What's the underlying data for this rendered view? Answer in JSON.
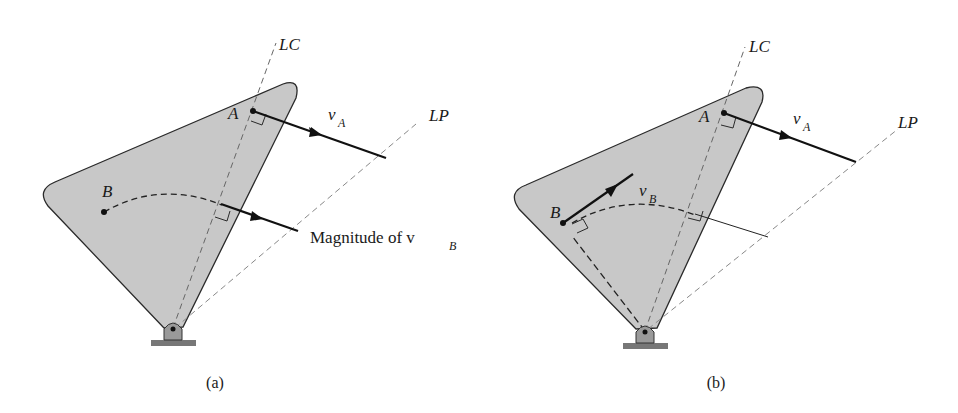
{
  "figure": {
    "panels": [
      {
        "id": "a",
        "caption": "(a)",
        "labels": {
          "lc": "LC",
          "lp": "LP",
          "point_a": "A",
          "point_b": "B",
          "velocity_a": "v",
          "velocity_a_sub": "A",
          "magnitude_text": "Magnitude of v",
          "magnitude_sub": "B"
        }
      },
      {
        "id": "b",
        "caption": "(b)",
        "labels": {
          "lc": "LC",
          "lp": "LP",
          "point_a": "A",
          "point_b": "B",
          "velocity_a": "v",
          "velocity_a_sub": "A",
          "velocity_b": "v",
          "velocity_b_sub": "B"
        }
      }
    ],
    "colors": {
      "body_fill": "#c8c8c8",
      "outline": "#2a2a2a",
      "dashed_line": "#7a7a7a",
      "vector": "#111111"
    }
  }
}
